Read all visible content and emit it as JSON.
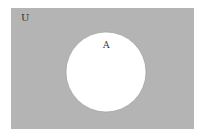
{
  "diagram": {
    "type": "venn",
    "universe": {
      "label": "U",
      "fill": "#b4b4b4",
      "x": 11,
      "y": 8,
      "width": 183,
      "height": 121
    },
    "sets": [
      {
        "label": "A",
        "fill": "#ffffff",
        "cx": 106,
        "cy": 72,
        "r": 40
      }
    ],
    "shaded_region": "complement of A (U \\ A)"
  }
}
